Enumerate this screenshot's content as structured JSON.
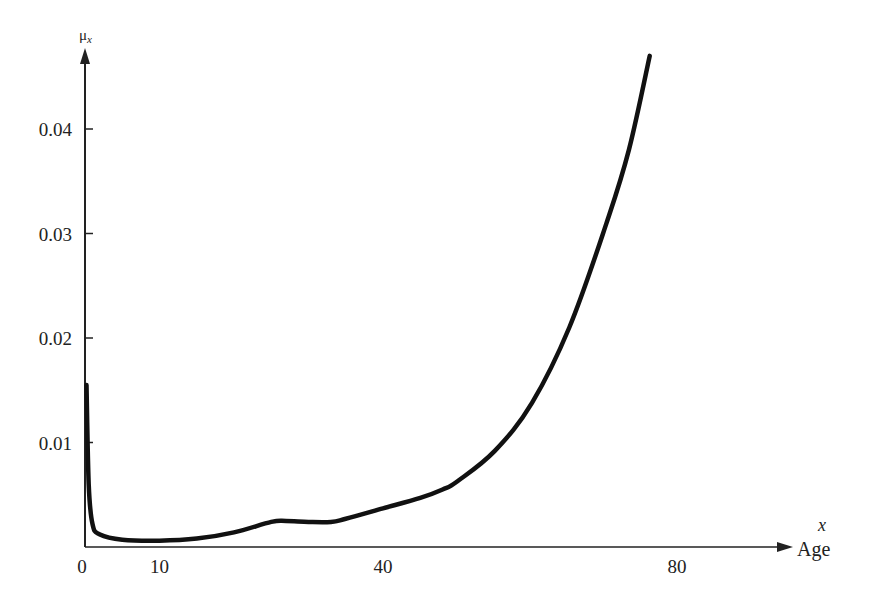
{
  "chart_data": {
    "type": "line",
    "title": "",
    "xlabel": "Age",
    "xlabel_var": "x",
    "ylabel": "μ",
    "ylabel_sub": "x",
    "xlim": [
      0,
      95
    ],
    "ylim": [
      0,
      0.048
    ],
    "grid": false,
    "legend": null,
    "x_ticks": [
      {
        "value": 0,
        "label": "0"
      },
      {
        "value": 10,
        "label": "10"
      },
      {
        "value": 40,
        "label": "40"
      },
      {
        "value": 80,
        "label": "80"
      }
    ],
    "y_ticks": [
      {
        "value": 0.01,
        "label": "0.01"
      },
      {
        "value": 0.02,
        "label": "0.02"
      },
      {
        "value": 0.03,
        "label": "0.03"
      },
      {
        "value": 0.04,
        "label": "0.04"
      }
    ],
    "series": [
      {
        "name": "Force of mortality μx",
        "x": [
          0,
          0.5,
          1,
          2,
          5,
          10,
          15,
          20,
          25,
          27,
          30,
          33,
          35,
          40,
          45,
          48,
          50,
          55,
          60,
          65,
          70,
          73,
          75.8
        ],
        "values": [
          0.0155,
          0.006,
          0.0022,
          0.0012,
          0.0007,
          0.0006,
          0.0008,
          0.0014,
          0.0024,
          0.0025,
          0.0024,
          0.0024,
          0.0027,
          0.0037,
          0.0047,
          0.0055,
          0.0063,
          0.0092,
          0.0138,
          0.021,
          0.031,
          0.038,
          0.047
        ]
      }
    ]
  },
  "axis": {
    "y_var": "μ",
    "y_sub": "x",
    "x_var": "x",
    "x_name": "Age"
  }
}
